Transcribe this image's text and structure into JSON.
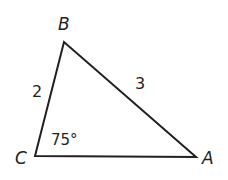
{
  "figure": {
    "type": "triangle",
    "vertices": {
      "A": {
        "label": "A"
      },
      "B": {
        "label": "B"
      },
      "C": {
        "label": "C"
      }
    },
    "sides": {
      "BC": {
        "label": "2"
      },
      "AB": {
        "label": "3"
      }
    },
    "angles": {
      "C": {
        "label": "75°"
      }
    },
    "stroke_color": "#231f20"
  }
}
